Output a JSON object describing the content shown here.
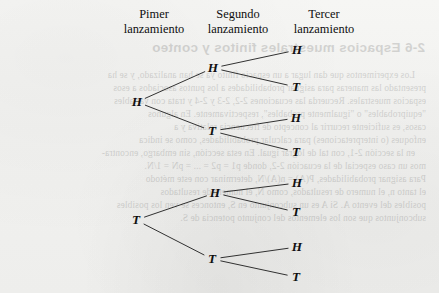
{
  "page": {
    "background_color": "#f3f3f1",
    "ink_color": "#101010"
  },
  "headers": [
    {
      "line1": "Pimer",
      "line2": "lanzamiento"
    },
    {
      "line1": "Segundo",
      "line2": "lanzamiento"
    },
    {
      "line1": "Tercer",
      "line2": "lanzamiento"
    }
  ],
  "tree": {
    "type": "probability-tree",
    "description": "Tree diagram of three successive coin tosses",
    "nodes": [
      {
        "id": "root",
        "label": "H",
        "x": 137,
        "y": 102,
        "level": 1
      },
      {
        "id": "root-t",
        "label": "T",
        "x": 136,
        "y": 220,
        "level": 1
      },
      {
        "id": "h-h",
        "label": "H",
        "x": 213,
        "y": 68,
        "level": 2
      },
      {
        "id": "h-t",
        "label": "T",
        "x": 212,
        "y": 131,
        "level": 2
      },
      {
        "id": "t-h",
        "label": "H",
        "x": 215,
        "y": 193,
        "level": 2
      },
      {
        "id": "t-t",
        "label": "T",
        "x": 212,
        "y": 259,
        "level": 2
      },
      {
        "id": "h-h-h",
        "label": "H",
        "x": 297,
        "y": 50,
        "level": 3
      },
      {
        "id": "h-h-t",
        "label": "T",
        "x": 296,
        "y": 87,
        "level": 3
      },
      {
        "id": "h-t-h",
        "label": "H",
        "x": 296,
        "y": 118,
        "level": 3
      },
      {
        "id": "h-t-t",
        "label": "T",
        "x": 296,
        "y": 152,
        "level": 3
      },
      {
        "id": "t-h-h",
        "label": "H",
        "x": 297,
        "y": 183,
        "level": 3
      },
      {
        "id": "t-h-t",
        "label": "T",
        "x": 296,
        "y": 212,
        "level": 3
      },
      {
        "id": "t-t-h",
        "label": "H",
        "x": 297,
        "y": 247,
        "level": 3
      },
      {
        "id": "t-t-t",
        "label": "T",
        "x": 296,
        "y": 277,
        "level": 3
      }
    ],
    "edges": [
      {
        "from": "root",
        "to": "h-h"
      },
      {
        "from": "root",
        "to": "h-t"
      },
      {
        "from": "root-t",
        "to": "t-h"
      },
      {
        "from": "root-t",
        "to": "t-t"
      },
      {
        "from": "h-h",
        "to": "h-h-h"
      },
      {
        "from": "h-h",
        "to": "h-h-t"
      },
      {
        "from": "h-t",
        "to": "h-t-h"
      },
      {
        "from": "h-t",
        "to": "h-t-t"
      },
      {
        "from": "t-h",
        "to": "t-h-h"
      },
      {
        "from": "t-h",
        "to": "t-h-t"
      },
      {
        "from": "t-t",
        "to": "t-t-h"
      },
      {
        "from": "t-t",
        "to": "t-t-t"
      }
    ]
  },
  "bleed_through": {
    "note": "Faint mirrored text showing through from the reverse side of the printed page",
    "heading": "2-6  Espacios muestrales finitos y conteo",
    "paragraphs": [
      "Los experimentos que dan lugar a un espacio finito ya se han analizado, y se ha",
      "presentado las maneras para asignar probabilidades a los puntos asociados a esos",
      "espacios muestrales. Recuerda las ecuaciones 2-2, 2-3 y 2-4 y trata con variables",
      "\"equiprobables\" o \"igualmente probables\", respectivamente. En algunos",
      "casos, es suficiente recurrir al concepto de frecuencia relativa y a",
      "enfoques (o interpretaciones) para calcular probabilidades, como se indica",
      "en la sección 2-1, con tal de lograr igual. En esta sección, sin embargo, encontra-",
      "mos un caso especial de la ecuación 2-2, donde p1 = p2 = ... = pN = 1/N.",
      "Para asignar probabilidades, P(A) = n(A)/N, determinar con este método",
      "el tanto n, el numero de resultados, como N, el numero de resultados",
      "posibles del evento A. Si A es un subconjunto en S, entonces se ven los posibles",
      "subconjuntos que son los elementos del conjunto potencia de S."
    ]
  }
}
